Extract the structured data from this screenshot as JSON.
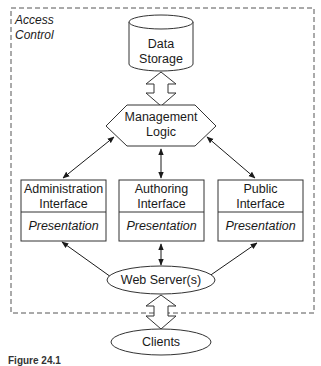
{
  "diagram": {
    "boundary": {
      "label_line1": "Access",
      "label_line2": "Control"
    },
    "nodes": {
      "data_storage": {
        "line1": "Data",
        "line2": "Storage",
        "shape": "cylinder"
      },
      "management_logic": {
        "line1": "Management",
        "line2": "Logic",
        "shape": "hexagon"
      },
      "admin_interface": {
        "line1": "Administration",
        "line2": "Interface",
        "sub": "Presentation",
        "shape": "box"
      },
      "authoring_interface": {
        "line1": "Authoring",
        "line2": "Interface",
        "sub": "Presentation",
        "shape": "box"
      },
      "public_interface": {
        "line1": "Public",
        "line2": "Interface",
        "sub": "Presentation",
        "shape": "box"
      },
      "web_servers": {
        "label": "Web Server(s)",
        "shape": "ellipse"
      },
      "clients": {
        "label": "Clients",
        "shape": "ellipse"
      }
    },
    "edges": [
      {
        "from": "data_storage",
        "to": "management_logic",
        "style": "block-double-arrow"
      },
      {
        "from": "management_logic",
        "to": "admin_interface",
        "style": "double-arrow"
      },
      {
        "from": "management_logic",
        "to": "authoring_interface",
        "style": "double-arrow"
      },
      {
        "from": "management_logic",
        "to": "public_interface",
        "style": "double-arrow"
      },
      {
        "from": "admin_interface",
        "to": "web_servers",
        "style": "double-arrow"
      },
      {
        "from": "authoring_interface",
        "to": "web_servers",
        "style": "double-arrow"
      },
      {
        "from": "public_interface",
        "to": "web_servers",
        "style": "double-arrow"
      },
      {
        "from": "web_servers",
        "to": "clients",
        "style": "block-double-arrow"
      }
    ],
    "caption": "Figure 24.1"
  }
}
